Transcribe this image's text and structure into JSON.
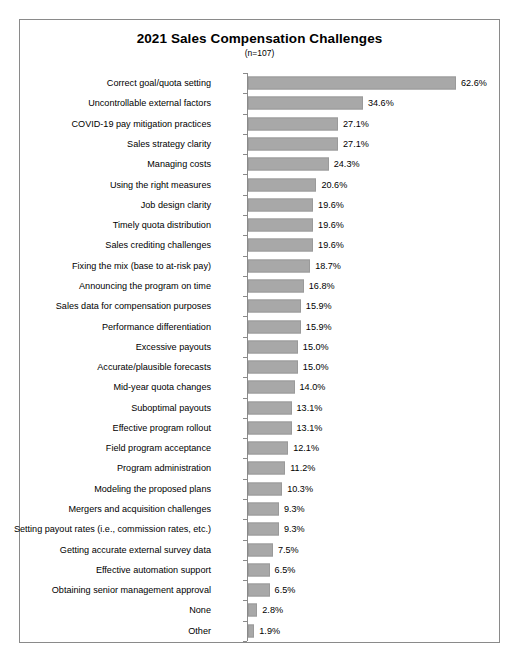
{
  "chart_data": {
    "type": "bar",
    "orientation": "horizontal",
    "title": "2021 Sales Compensation Challenges",
    "subtitle": "(n=107)",
    "xlabel": "",
    "ylabel": "",
    "xlim": [
      0,
      62.6
    ],
    "grid": false,
    "legend": null,
    "value_suffix": "%",
    "categories": [
      "Correct goal/quota setting",
      "Uncontrollable external factors",
      "COVID-19 pay mitigation practices",
      "Sales strategy clarity",
      "Managing costs",
      "Using the right measures",
      "Job design clarity",
      "Timely quota distribution",
      "Sales crediting challenges",
      "Fixing the mix (base to at-risk pay)",
      "Announcing the program on time",
      "Sales data for compensation purposes",
      "Performance differentiation",
      "Excessive payouts",
      "Accurate/plausible forecasts",
      "Mid-year quota changes",
      "Suboptimal payouts",
      "Effective program rollout",
      "Field program acceptance",
      "Program administration",
      "Modeling the proposed plans",
      "Mergers and acquisition challenges",
      "Setting payout rates (i.e., commission rates, etc.)",
      "Getting accurate external survey data",
      "Effective automation support",
      "Obtaining senior management approval",
      "None",
      "Other"
    ],
    "values": [
      62.6,
      34.6,
      27.1,
      27.1,
      24.3,
      20.6,
      19.6,
      19.6,
      19.6,
      18.7,
      16.8,
      15.9,
      15.9,
      15.0,
      15.0,
      14.0,
      13.1,
      13.1,
      12.1,
      11.2,
      10.3,
      9.3,
      9.3,
      7.5,
      6.5,
      6.5,
      2.8,
      1.9
    ],
    "value_labels": [
      "62.6%",
      "34.6%",
      "27.1%",
      "27.1%",
      "24.3%",
      "20.6%",
      "19.6%",
      "19.6%",
      "19.6%",
      "18.7%",
      "16.8%",
      "15.9%",
      "15.9%",
      "15.0%",
      "15.0%",
      "14.0%",
      "13.1%",
      "13.1%",
      "12.1%",
      "11.2%",
      "10.3%",
      "9.3%",
      "9.3%",
      "7.5%",
      "6.5%",
      "6.5%",
      "2.8%",
      "1.9%"
    ],
    "colors": {
      "bar_fill": "#a8a8a8",
      "bar_edge": "#9a9a9a",
      "axis": "#8a8a8a",
      "frame": "#8a8a8a",
      "text": "#000000",
      "background": "#ffffff"
    }
  }
}
